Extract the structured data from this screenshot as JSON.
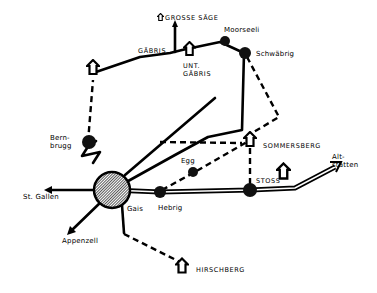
{
  "map": {
    "type": "hand-drawn route map",
    "places": {
      "grosse_saege": "GROSSE SÄGE",
      "moorseeli": "Moorseeli",
      "gaebris": "GÄBRIS",
      "schwaebrig": "Schwäbrig",
      "unt_gaebris": "UNT.\nGÄBRIS",
      "bernbrugg": "Bern-\nbrugg",
      "sommersberg": "SOMMERSBERG",
      "egg": "Egg",
      "altstaetten": "Alt-\nstätten",
      "st_gallen": "St. Gallen",
      "stoss": "STOSS",
      "gais": "Gais",
      "hebrig": "Hebrig",
      "appenzell": "Appenzell",
      "hirschberg": "HIRSCHBERG"
    },
    "legend_symbols": {
      "house": "house-icon (mountain inn / hut)",
      "dot": "station / hamlet",
      "big_dot": "town hub (Gais)",
      "solid_line": "road",
      "dashed_line": "footpath",
      "double_line": "railway"
    },
    "colors": {
      "ink": "#000000",
      "paper": "#ffffff"
    }
  }
}
